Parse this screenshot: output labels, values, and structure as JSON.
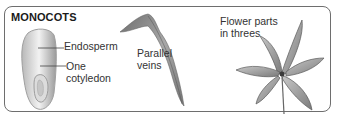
{
  "diagram": {
    "title": "MONOCOTS",
    "seed": {
      "labels": {
        "endosperm": "Endosperm",
        "cotyledon_line1": "One",
        "cotyledon_line2": "cotyledon"
      }
    },
    "leaf": {
      "label_line1": "Parallel",
      "label_line2": "veins"
    },
    "flower": {
      "label_line1": "Flower parts",
      "label_line2": "in threes"
    },
    "colors": {
      "border": "#6e6e6e",
      "text": "#333333",
      "illustration": "#8a8a8a"
    }
  }
}
